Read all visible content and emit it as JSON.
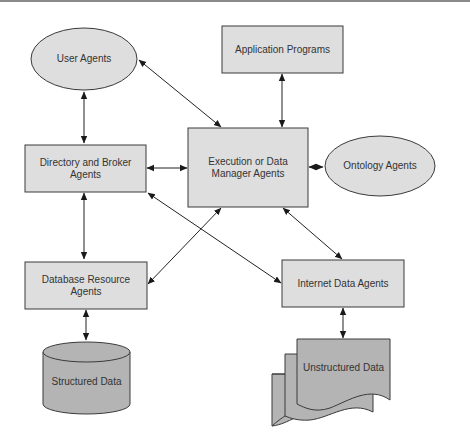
{
  "diagram": {
    "nodes": {
      "user_agents": {
        "label": "User Agents",
        "shape": "ellipse"
      },
      "application_programs": {
        "label": "Application Programs",
        "shape": "rectangle"
      },
      "directory_broker": {
        "label": "Directory and Broker\nAgents",
        "shape": "rectangle"
      },
      "execution_manager": {
        "label": "Execution or Data\nManager Agents",
        "shape": "rectangle"
      },
      "ontology_agents": {
        "label": "Ontology Agents",
        "shape": "ellipse"
      },
      "database_resource": {
        "label": "Database Resource\nAgents",
        "shape": "rectangle"
      },
      "internet_data": {
        "label": "Internet Data Agents",
        "shape": "rectangle"
      },
      "structured_data": {
        "label": "Structured Data",
        "shape": "cylinder"
      },
      "unstructured_data": {
        "label": "Unstructured Data",
        "shape": "multi-document"
      }
    },
    "edges": [
      {
        "from": "User Agents",
        "to": "Directory and Broker Agents",
        "direction": "bidirectional"
      },
      {
        "from": "User Agents",
        "to": "Execution or Data Manager Agents",
        "direction": "bidirectional"
      },
      {
        "from": "Application Programs",
        "to": "Execution or Data Manager Agents",
        "direction": "bidirectional"
      },
      {
        "from": "Directory and Broker Agents",
        "to": "Execution or Data Manager Agents",
        "direction": "bidirectional"
      },
      {
        "from": "Execution or Data Manager Agents",
        "to": "Ontology Agents",
        "direction": "bidirectional"
      },
      {
        "from": "Directory and Broker Agents",
        "to": "Database Resource Agents",
        "direction": "bidirectional"
      },
      {
        "from": "Directory and Broker Agents",
        "to": "Internet Data Agents",
        "direction": "bidirectional"
      },
      {
        "from": "Execution or Data Manager Agents",
        "to": "Database Resource Agents",
        "direction": "bidirectional"
      },
      {
        "from": "Execution or Data Manager Agents",
        "to": "Internet Data Agents",
        "direction": "bidirectional"
      },
      {
        "from": "Database Resource Agents",
        "to": "Structured Data",
        "direction": "bidirectional"
      },
      {
        "from": "Internet Data Agents",
        "to": "Unstructured Data",
        "direction": "bidirectional"
      }
    ],
    "colors": {
      "light_fill": "#dedede",
      "dark_fill": "#b4b4b4",
      "stroke": "#3a3a3a"
    }
  }
}
